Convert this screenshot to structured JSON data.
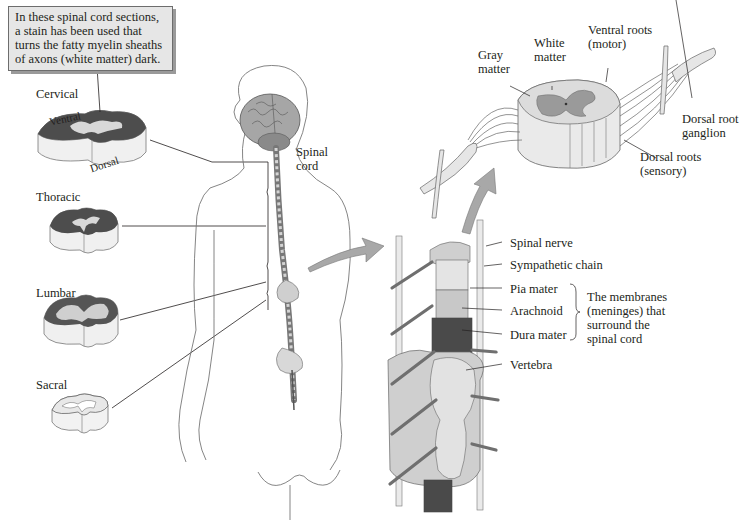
{
  "callout": {
    "lines": [
      "In these spinal cord sections,",
      "a stain has been used that",
      "turns the fatty myelin sheaths",
      "of axons (white matter) dark."
    ]
  },
  "sections": {
    "cervical": "Cervical",
    "ventral": "Ventral",
    "dorsal": "Dorsal",
    "thoracic": "Thoracic",
    "lumbar": "Lumbar",
    "sacral": "Sacral"
  },
  "body": {
    "spinal_cord": [
      "Spinal",
      "cord"
    ]
  },
  "cross_section": {
    "gray_matter": [
      "Gray",
      "matter"
    ],
    "white_matter": [
      "White",
      "matter"
    ],
    "ventral_roots": [
      "Ventral roots",
      "(motor)"
    ],
    "dorsal_root_ganglion": [
      "Dorsal root",
      "ganglion"
    ],
    "dorsal_roots": [
      "Dorsal roots",
      "(sensory)"
    ]
  },
  "column": {
    "spinal_nerve": "Spinal nerve",
    "sympathetic_chain": "Sympathetic chain",
    "pia_mater": "Pia mater",
    "arachnoid": "Arachnoid",
    "dura_mater": "Dura mater",
    "vertebra": "Vertebra",
    "meninges_note": [
      "The membranes",
      "(meninges) that",
      "surround the",
      "spinal cord"
    ]
  },
  "colors": {
    "line": "#231f20",
    "outline": "#8a8a8a",
    "gray_fill": "#c8c8c8",
    "light_fill": "#e4e4e4",
    "dark_fill": "#4a4a4a",
    "arrow_fill": "#a8a8a8",
    "callout_bg": "#e6e6e6"
  }
}
